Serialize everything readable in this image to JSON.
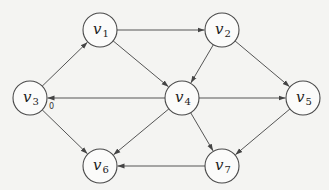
{
  "diagram": {
    "type": "directed-graph",
    "nodes": [
      {
        "id": "v1",
        "base": "v",
        "sub": "1",
        "x": 100,
        "y": 30
      },
      {
        "id": "v2",
        "base": "v",
        "sub": "2",
        "x": 222,
        "y": 30
      },
      {
        "id": "v3",
        "base": "v",
        "sub": "3",
        "x": 30,
        "y": 98
      },
      {
        "id": "v4",
        "base": "v",
        "sub": "4",
        "x": 182,
        "y": 98
      },
      {
        "id": "v5",
        "base": "v",
        "sub": "5",
        "x": 303,
        "y": 98
      },
      {
        "id": "v6",
        "base": "v",
        "sub": "6",
        "x": 100,
        "y": 166
      },
      {
        "id": "v7",
        "base": "v",
        "sub": "7",
        "x": 222,
        "y": 166
      }
    ],
    "edges": [
      {
        "from": "v3",
        "to": "v1",
        "label": ""
      },
      {
        "from": "v1",
        "to": "v2",
        "label": ""
      },
      {
        "from": "v1",
        "to": "v4",
        "label": ""
      },
      {
        "from": "v2",
        "to": "v4",
        "label": ""
      },
      {
        "from": "v2",
        "to": "v5",
        "label": ""
      },
      {
        "from": "v4",
        "to": "v3",
        "label": "0"
      },
      {
        "from": "v4",
        "to": "v5",
        "label": ""
      },
      {
        "from": "v3",
        "to": "v6",
        "label": ""
      },
      {
        "from": "v4",
        "to": "v6",
        "label": ""
      },
      {
        "from": "v4",
        "to": "v7",
        "label": ""
      },
      {
        "from": "v5",
        "to": "v7",
        "label": ""
      },
      {
        "from": "v7",
        "to": "v6",
        "label": ""
      }
    ],
    "node_radius": 17,
    "colors": {
      "stroke": "#4a4a4a",
      "edge": "#555555",
      "background": "#f4f4f2"
    }
  }
}
